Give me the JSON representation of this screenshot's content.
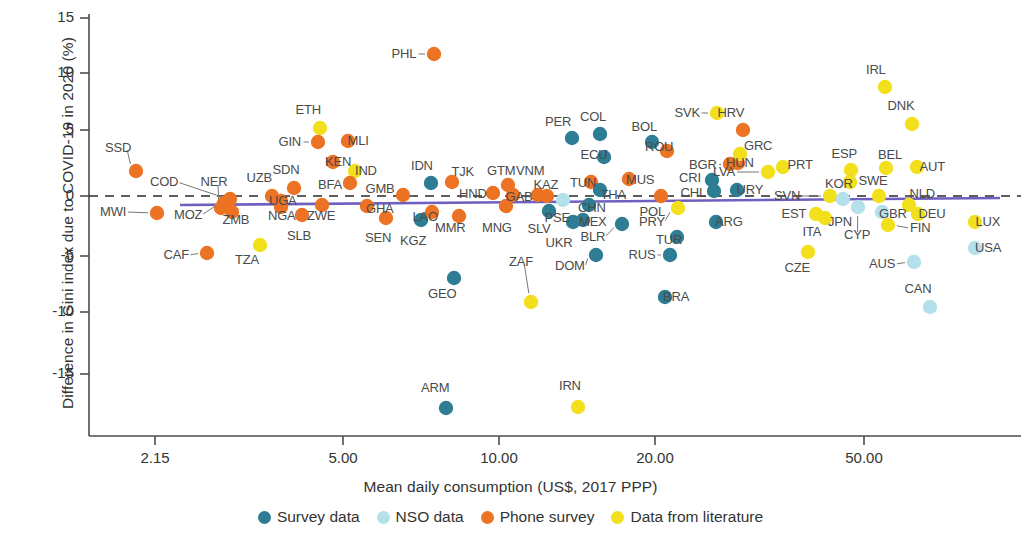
{
  "chart_data": {
    "type": "scatter",
    "title": "",
    "xlabel": "Mean daily consumption (US$, 2017 PPP)",
    "ylabel": "Difference in Gini index due to COVID-19 in 2020 (%)",
    "xscale": "log",
    "xticks": [
      "2.15",
      "5.00",
      "10.00",
      "20.00",
      "50.00"
    ],
    "xtick_values": [
      2.15,
      5.0,
      10.0,
      20.0,
      50.0
    ],
    "yticks": [
      "15",
      "10",
      "5",
      "0",
      "-5",
      "-10",
      "-15"
    ],
    "ytick_values": [
      15,
      10,
      5,
      0,
      -5,
      -10,
      -15
    ],
    "ylim": [
      -18.5,
      15.8
    ],
    "grid": false,
    "zero_reference_line": true,
    "trend_line": {
      "color": "#6f5fc0",
      "y_left": -0.95,
      "y_right": -0.15
    },
    "legend_position": "bottom",
    "series": [
      {
        "name": "Survey data",
        "color": "#2d7d94"
      },
      {
        "name": "NSO data",
        "color": "#b3e0ea"
      },
      {
        "name": "Phone survey",
        "color": "#ed7324"
      },
      {
        "name": "Data from literature",
        "color": "#f2e01c"
      }
    ],
    "points": [
      {
        "code": "SSD",
        "series": "Phone survey",
        "px": 136,
        "py": 171,
        "lx": 118,
        "ly": 148
      },
      {
        "code": "MWI",
        "series": "Phone survey",
        "px": 157,
        "py": 213,
        "lx": 113,
        "ly": 212
      },
      {
        "code": "COD",
        "series": "Phone survey",
        "px": 230,
        "py": 199,
        "lx": 164,
        "ly": 182
      },
      {
        "code": "MOZ",
        "series": "Phone survey",
        "px": 224,
        "py": 203,
        "lx": 188,
        "ly": 215
      },
      {
        "code": "NER",
        "series": "Phone survey",
        "px": 221,
        "py": 208,
        "lx": 214,
        "ly": 182
      },
      {
        "code": "ZMB",
        "series": "Phone survey",
        "px": 232,
        "py": 212,
        "lx": 236,
        "ly": 220
      },
      {
        "code": "UZB",
        "series": "Phone survey",
        "px": 272,
        "py": 196,
        "lx": 259,
        "ly": 178
      },
      {
        "code": "SDN",
        "series": "Phone survey",
        "px": 294,
        "py": 188,
        "lx": 286,
        "ly": 170
      },
      {
        "code": "UGA",
        "series": "Phone survey",
        "px": 281,
        "py": 201,
        "lx": 283,
        "ly": 201
      },
      {
        "code": "NGA",
        "series": "Phone survey",
        "px": 281,
        "py": 207,
        "lx": 282,
        "ly": 216
      },
      {
        "code": "SLB",
        "series": "Phone survey",
        "px": 302,
        "py": 215,
        "lx": 299,
        "ly": 236
      },
      {
        "code": "ZWE",
        "series": "Phone survey",
        "px": 322,
        "py": 205,
        "lx": 321,
        "ly": 216
      },
      {
        "code": "CAF",
        "series": "Phone survey",
        "px": 207,
        "py": 253,
        "lx": 176,
        "ly": 255
      },
      {
        "code": "TZA",
        "series": "Data from literature",
        "px": 260,
        "py": 245,
        "lx": 247,
        "ly": 260
      },
      {
        "code": "ETH",
        "series": "Data from literature",
        "px": 320,
        "py": 128,
        "lx": 308,
        "ly": 110
      },
      {
        "code": "GIN",
        "series": "Phone survey",
        "px": 318,
        "py": 142,
        "lx": 290,
        "ly": 142
      },
      {
        "code": "MLI",
        "series": "Phone survey",
        "px": 348,
        "py": 141,
        "lx": 358,
        "ly": 141
      },
      {
        "code": "KEN",
        "series": "Phone survey",
        "px": 333,
        "py": 162,
        "lx": 338,
        "ly": 162
      },
      {
        "code": "IND",
        "series": "Data from literature",
        "px": 355,
        "py": 171,
        "lx": 366,
        "ly": 171
      },
      {
        "code": "BFA",
        "series": "Phone survey",
        "px": 350,
        "py": 183,
        "lx": 330,
        "ly": 185
      },
      {
        "code": "GHA",
        "series": "Phone survey",
        "px": 367,
        "py": 206,
        "lx": 380,
        "ly": 209
      },
      {
        "code": "SEN",
        "series": "Phone survey",
        "px": 386,
        "py": 218,
        "lx": 378,
        "ly": 238
      },
      {
        "code": "GMB",
        "series": "Phone survey",
        "px": 403,
        "py": 195,
        "lx": 380,
        "ly": 189
      },
      {
        "code": "KGZ",
        "series": "Survey data",
        "px": 421,
        "py": 220,
        "lx": 413,
        "ly": 241
      },
      {
        "code": "LAO",
        "series": "Phone survey",
        "px": 432,
        "py": 212,
        "lx": 425,
        "ly": 217
      },
      {
        "code": "MMR",
        "series": "Phone survey",
        "px": 459,
        "py": 216,
        "lx": 450,
        "ly": 228
      },
      {
        "code": "IDN",
        "series": "Survey data",
        "px": 431,
        "py": 183,
        "lx": 422,
        "ly": 166
      },
      {
        "code": "TJK",
        "series": "Phone survey",
        "px": 452,
        "py": 182,
        "lx": 463,
        "ly": 172
      },
      {
        "code": "GEO",
        "series": "Survey data",
        "px": 454,
        "py": 278,
        "lx": 442,
        "ly": 294
      },
      {
        "code": "ARM",
        "series": "Survey data",
        "px": 446,
        "py": 408,
        "lx": 435,
        "ly": 388
      },
      {
        "code": "PHL",
        "series": "Phone survey",
        "px": 434,
        "py": 54,
        "lx": 404,
        "ly": 54
      },
      {
        "code": "GTM",
        "series": "Phone survey",
        "px": 508,
        "py": 185,
        "lx": 501,
        "ly": 171
      },
      {
        "code": "HND",
        "series": "Phone survey",
        "px": 493,
        "py": 193,
        "lx": 473,
        "ly": 194
      },
      {
        "code": "GAB",
        "series": "Phone survey",
        "px": 513,
        "py": 195,
        "lx": 519,
        "ly": 197
      },
      {
        "code": "MNG",
        "series": "Phone survey",
        "px": 506,
        "py": 206,
        "lx": 497,
        "ly": 228
      },
      {
        "code": "VNM",
        "series": "Phone survey",
        "px": 538,
        "py": 195,
        "lx": 530,
        "ly": 171
      },
      {
        "code": "KAZ",
        "series": "Phone survey",
        "px": 547,
        "py": 196,
        "lx": 546,
        "ly": 185
      },
      {
        "code": "SLV",
        "series": "Survey data",
        "px": 549,
        "py": 211,
        "lx": 539,
        "ly": 229
      },
      {
        "code": "PSE",
        "series": "NSO data",
        "px": 563,
        "py": 200,
        "lx": 557,
        "ly": 218
      },
      {
        "code": "UKR",
        "series": "Survey data",
        "px": 573,
        "py": 222,
        "lx": 559,
        "ly": 243
      },
      {
        "code": "ZAF",
        "series": "Data from literature",
        "px": 531,
        "py": 302,
        "lx": 521,
        "ly": 262
      },
      {
        "code": "IRN",
        "series": "Data from literature",
        "px": 578,
        "py": 407,
        "lx": 570,
        "ly": 386
      },
      {
        "code": "DOM",
        "series": "Survey data",
        "px": 596,
        "py": 255,
        "lx": 570,
        "ly": 266
      },
      {
        "code": "CHN",
        "series": "Survey data",
        "px": 589,
        "py": 205,
        "lx": 592,
        "ly": 208
      },
      {
        "code": "MEX",
        "series": "Survey data",
        "px": 583,
        "py": 220,
        "lx": 593,
        "ly": 222
      },
      {
        "code": "TUN",
        "series": "Phone survey",
        "px": 591,
        "py": 182,
        "lx": 583,
        "ly": 183
      },
      {
        "code": "THA",
        "series": "Survey data",
        "px": 600,
        "py": 190,
        "lx": 613,
        "ly": 195
      },
      {
        "code": "ECU",
        "series": "Survey data",
        "px": 604,
        "py": 157,
        "lx": 594,
        "ly": 155
      },
      {
        "code": "PER",
        "series": "Survey data",
        "px": 572,
        "py": 138,
        "lx": 558,
        "ly": 122
      },
      {
        "code": "COL",
        "series": "Survey data",
        "px": 600,
        "py": 134,
        "lx": 593,
        "ly": 117
      },
      {
        "code": "BLR",
        "series": "Survey data",
        "px": 622,
        "py": 224,
        "lx": 593,
        "ly": 237
      },
      {
        "code": "MUS",
        "series": "Phone survey",
        "px": 629,
        "py": 179,
        "lx": 640,
        "ly": 180
      },
      {
        "code": "BOL",
        "series": "Survey data",
        "px": 652,
        "py": 142,
        "lx": 644,
        "ly": 127
      },
      {
        "code": "ROU",
        "series": "Phone survey",
        "px": 667,
        "py": 151,
        "lx": 659,
        "ly": 147
      },
      {
        "code": "POL",
        "series": "Phone survey",
        "px": 661,
        "py": 196,
        "lx": 652,
        "ly": 212
      },
      {
        "code": "PRY",
        "series": "Data from literature",
        "px": 678,
        "py": 208,
        "lx": 652,
        "ly": 222
      },
      {
        "code": "RUS",
        "series": "Survey data",
        "px": 670,
        "py": 255,
        "lx": 642,
        "ly": 255
      },
      {
        "code": "TUR",
        "series": "Survey data",
        "px": 677,
        "py": 237,
        "lx": 669,
        "ly": 240
      },
      {
        "code": "BRA",
        "series": "Survey data",
        "px": 665,
        "py": 297,
        "lx": 676,
        "ly": 297
      },
      {
        "code": "CRI",
        "series": "Survey data",
        "px": 712,
        "py": 180,
        "lx": 690,
        "ly": 178
      },
      {
        "code": "CHL",
        "series": "Survey data",
        "px": 714,
        "py": 191,
        "lx": 693,
        "ly": 193
      },
      {
        "code": "BGR",
        "series": "Phone survey",
        "px": 730,
        "py": 164,
        "lx": 703,
        "ly": 165
      },
      {
        "code": "HUN",
        "series": "Phone survey",
        "px": 738,
        "py": 163,
        "lx": 740,
        "ly": 163
      },
      {
        "code": "GRC",
        "series": "Data from literature",
        "px": 740,
        "py": 154,
        "lx": 758,
        "ly": 146
      },
      {
        "code": "URY",
        "series": "Survey data",
        "px": 737,
        "py": 190,
        "lx": 750,
        "ly": 190
      },
      {
        "code": "LVA",
        "series": "Data from literature",
        "px": 768,
        "py": 172,
        "lx": 724,
        "ly": 172
      },
      {
        "code": "ARG",
        "series": "Survey data",
        "px": 716,
        "py": 222,
        "lx": 729,
        "ly": 222
      },
      {
        "code": "SVK",
        "series": "Data from literature",
        "px": 717,
        "py": 113,
        "lx": 687,
        "ly": 113
      },
      {
        "code": "HRV",
        "series": "Phone survey",
        "px": 743,
        "py": 130,
        "lx": 731,
        "ly": 113
      },
      {
        "code": "PRT",
        "series": "Data from literature",
        "px": 783,
        "py": 167,
        "lx": 800,
        "ly": 165
      },
      {
        "code": "SVN",
        "series": "Data from literature",
        "px": 830,
        "py": 196,
        "lx": 787,
        "ly": 196
      },
      {
        "code": "EST",
        "series": "Data from literature",
        "px": 816,
        "py": 214,
        "lx": 794,
        "ly": 214
      },
      {
        "code": "ITA",
        "series": "Data from literature",
        "px": 825,
        "py": 218,
        "lx": 812,
        "ly": 232
      },
      {
        "code": "JPN",
        "series": "NSO data",
        "px": 843,
        "py": 199,
        "lx": 840,
        "ly": 222
      },
      {
        "code": "KOR",
        "series": "Data from literature",
        "px": 850,
        "py": 182,
        "lx": 839,
        "ly": 184
      },
      {
        "code": "CYP",
        "series": "NSO data",
        "px": 858,
        "py": 207,
        "lx": 857,
        "ly": 235
      },
      {
        "code": "ESP",
        "series": "Data from literature",
        "px": 851,
        "py": 170,
        "lx": 844,
        "ly": 154
      },
      {
        "code": "SWE",
        "series": "Data from literature",
        "px": 879,
        "py": 196,
        "lx": 873,
        "ly": 181
      },
      {
        "code": "BEL",
        "series": "Data from literature",
        "px": 886,
        "py": 168,
        "lx": 890,
        "ly": 155
      },
      {
        "code": "GBR",
        "series": "NSO data",
        "px": 882,
        "py": 212,
        "lx": 893,
        "ly": 214
      },
      {
        "code": "FIN",
        "series": "Data from literature",
        "px": 888,
        "py": 225,
        "lx": 920,
        "ly": 228
      },
      {
        "code": "NLD",
        "series": "Data from literature",
        "px": 909,
        "py": 205,
        "lx": 922,
        "ly": 194
      },
      {
        "code": "AUT",
        "series": "Data from literature",
        "px": 917,
        "py": 167,
        "lx": 932,
        "ly": 167
      },
      {
        "code": "DEU",
        "series": "Data from literature",
        "px": 918,
        "py": 214,
        "lx": 932,
        "ly": 214
      },
      {
        "code": "IRL",
        "series": "Data from literature",
        "px": 885,
        "py": 87,
        "lx": 876,
        "ly": 70
      },
      {
        "code": "DNK",
        "series": "Data from literature",
        "px": 912,
        "py": 124,
        "lx": 901,
        "ly": 106
      },
      {
        "code": "CZE",
        "series": "Data from literature",
        "px": 808,
        "py": 252,
        "lx": 797,
        "ly": 268
      },
      {
        "code": "AUS",
        "series": "NSO data",
        "px": 914,
        "py": 262,
        "lx": 882,
        "ly": 264
      },
      {
        "code": "CAN",
        "series": "NSO data",
        "px": 930,
        "py": 307,
        "lx": 918,
        "ly": 289
      },
      {
        "code": "LUX",
        "series": "Data from literature",
        "px": 975,
        "py": 222,
        "lx": 988,
        "ly": 222
      },
      {
        "code": "USA",
        "series": "NSO data",
        "px": 975,
        "py": 248,
        "lx": 988,
        "ly": 248
      }
    ]
  },
  "legend": {
    "items": [
      {
        "label": "Survey data",
        "color": "#2d7d94"
      },
      {
        "label": "NSO data",
        "color": "#b3e0ea"
      },
      {
        "label": "Phone survey",
        "color": "#ed7324"
      },
      {
        "label": "Data from literature",
        "color": "#f2e01c"
      }
    ]
  }
}
